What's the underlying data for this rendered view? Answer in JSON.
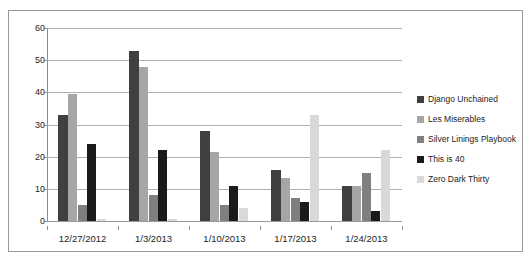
{
  "chart_data": {
    "type": "bar",
    "title": "",
    "subtitle": "",
    "xlabel": "",
    "ylabel": "",
    "ylim": [
      0,
      60
    ],
    "ytick_step": 10,
    "yticks": [
      0,
      10,
      20,
      30,
      40,
      50,
      60
    ],
    "grid": true,
    "legend_position": "right",
    "categories": [
      "12/27/2012",
      "1/3/2013",
      "1/10/2013",
      "1/17/2013",
      "1/24/2013"
    ],
    "series": [
      {
        "name": "Django Unchained",
        "color": "#404040",
        "values": [
          33,
          53,
          28,
          16,
          11
        ]
      },
      {
        "name": "Les Miserables",
        "color": "#a6a6a6",
        "values": [
          39.4,
          48,
          21.5,
          13.5,
          11
        ]
      },
      {
        "name": "Silver Linings Playbook",
        "color": "#7f7f7f",
        "values": [
          5,
          8,
          5,
          7,
          15
        ]
      },
      {
        "name": "This is 40",
        "color": "#1a1a1a",
        "values": [
          24,
          22,
          11,
          6,
          3
        ]
      },
      {
        "name": "Zero Dark Thirty",
        "color": "#d9d9d9",
        "values": [
          0.6,
          0.5,
          4,
          33,
          22
        ]
      }
    ]
  },
  "colors": {
    "gridline": "#b0b0b0",
    "axis": "#8a8a8a",
    "border": "#9a9a9a",
    "text": "#1c1c1c",
    "background": "#ffffff"
  }
}
